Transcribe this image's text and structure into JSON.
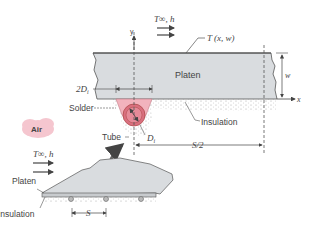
{
  "figure": {
    "labels": {
      "t_inf_h_top": "T∞, h",
      "t_xw": "T (x, w)",
      "y_axis": "y",
      "x_axis": "x",
      "platen_main": "Platen",
      "w_dim": "w",
      "two_di": "2D",
      "two_di_sub": "i",
      "solder": "Solder",
      "insulation_main": "Insulation",
      "tube": "Tube",
      "di": "D",
      "di_sub": "i",
      "s_half": "S/2",
      "air": "Air",
      "t_inf_h_left": "T∞, h",
      "platen_small": "Platen",
      "insulation_small": "Insulation",
      "s_dim": "S"
    },
    "colors": {
      "platen_fill": "#d9dcdf",
      "platen_stroke": "#555555",
      "solder_fill": "#f2b3bd",
      "tube_fill": "#d9707f",
      "tube_inner": "#e58a98",
      "air_cloud": "#f5c6cf",
      "insulation_dots": "#9a9a9a",
      "arrow": "#555555",
      "text": "#444444"
    }
  }
}
